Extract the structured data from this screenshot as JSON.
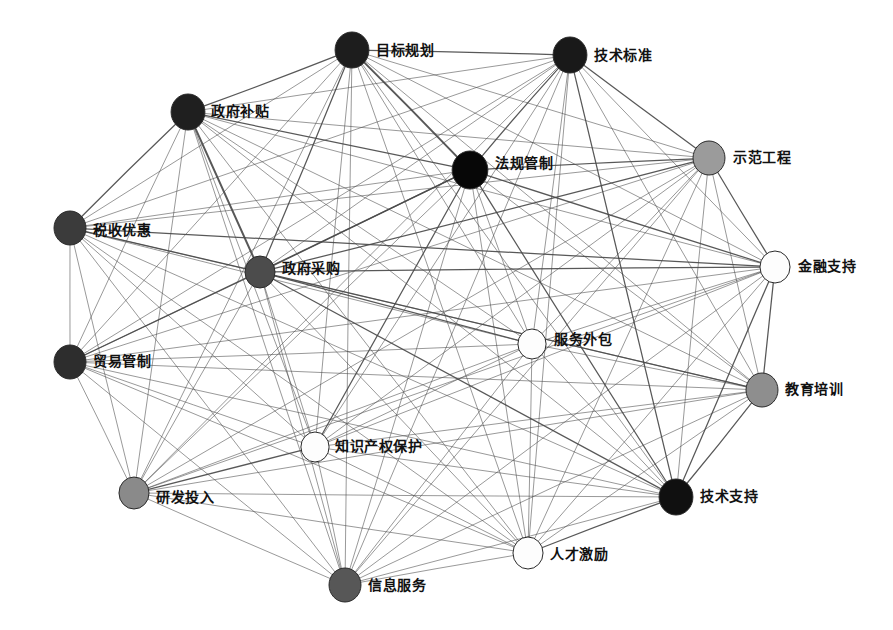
{
  "figure": {
    "type": "network-graph",
    "title": "",
    "background_color": "#ffffff",
    "width": 893,
    "height": 630,
    "edge_color": "#4a4a4a",
    "node_outline_color": "#2a2a2a"
  },
  "nodes": [
    {
      "id": "mubiao-guihua",
      "label": "目标规划",
      "x": 352,
      "y": 50,
      "r": 18,
      "color": "#1d1d1d",
      "label_dx": 24,
      "label_dy": 1
    },
    {
      "id": "jishu-biaozhun",
      "label": "技术标准",
      "x": 570,
      "y": 55,
      "r": 18,
      "color": "#191919",
      "label_dx": 24,
      "label_dy": 1
    },
    {
      "id": "zhengfu-butie",
      "label": "政府补贴",
      "x": 188,
      "y": 112,
      "r": 18,
      "color": "#1f1f1f",
      "label_dx": 23,
      "label_dy": 0
    },
    {
      "id": "fagui-guanzhi",
      "label": "法规管制",
      "x": 470,
      "y": 170,
      "r": 19,
      "color": "#070707",
      "label_dx": 25,
      "label_dy": -6
    },
    {
      "id": "shifan-gongcheng",
      "label": "示范工程",
      "x": 709,
      "y": 158,
      "r": 17,
      "color": "#9b9b9b",
      "label_dx": 24,
      "label_dy": 0
    },
    {
      "id": "shuishou-youhui",
      "label": "税收优惠",
      "x": 70,
      "y": 228,
      "r": 17,
      "color": "#3b3b3b",
      "label_dx": 23,
      "label_dy": 3
    },
    {
      "id": "zhengfu-caigou",
      "label": "政府采购",
      "x": 260,
      "y": 272,
      "r": 16,
      "color": "#4c4c4c",
      "label_dx": 22,
      "label_dy": -3
    },
    {
      "id": "jinrong-zhichi",
      "label": "金融支持",
      "x": 775,
      "y": 267,
      "r": 16,
      "color": "#fdfdfd",
      "label_dx": 23,
      "label_dy": 0
    },
    {
      "id": "fuwu-waibao",
      "label": "服务外包",
      "x": 532,
      "y": 344,
      "r": 15,
      "color": "#fdfdfd",
      "label_dx": 22,
      "label_dy": -4
    },
    {
      "id": "maoyi-guanzhi",
      "label": "贸易管制",
      "x": 70,
      "y": 362,
      "r": 17,
      "color": "#2d2d2d",
      "label_dx": 23,
      "label_dy": 0
    },
    {
      "id": "jiaoyu-peixun",
      "label": "教育培训",
      "x": 762,
      "y": 390,
      "r": 17,
      "color": "#8e8e8e",
      "label_dx": 23,
      "label_dy": 0
    },
    {
      "id": "zhishi-chanquan",
      "label": "知识产权保护",
      "x": 315,
      "y": 447,
      "r": 15,
      "color": "#fdfdfd",
      "label_dx": 20,
      "label_dy": 0
    },
    {
      "id": "yanfa-touru",
      "label": "研发投入",
      "x": 134,
      "y": 493,
      "r": 16,
      "color": "#8a8a8a",
      "label_dx": 22,
      "label_dy": 5
    },
    {
      "id": "jishu-zhichi",
      "label": "技术支持",
      "x": 676,
      "y": 497,
      "r": 18,
      "color": "#101010",
      "label_dx": 24,
      "label_dy": 0
    },
    {
      "id": "rencai-jili",
      "label": "人才激励",
      "x": 528,
      "y": 553,
      "r": 16,
      "color": "#fdfdfd",
      "label_dx": 22,
      "label_dy": 2
    },
    {
      "id": "xinxi-fuwu",
      "label": "信息服务",
      "x": 345,
      "y": 585,
      "r": 17,
      "color": "#575757",
      "label_dx": 23,
      "label_dy": 1
    }
  ],
  "chart_data": {
    "type": "network",
    "title": "",
    "node_count": 16,
    "node_order_dark_to_light": [
      "法规管制",
      "技术支持",
      "技术标准",
      "目标规划",
      "政府补贴",
      "贸易管制",
      "税收优惠",
      "政府采购",
      "信息服务",
      "研发投入",
      "教育培训",
      "示范工程",
      "金融支持",
      "服务外包",
      "知识产权保护",
      "人才激励"
    ],
    "edges": [
      [
        "目标规划",
        "技术标准",
        2
      ],
      [
        "目标规划",
        "政府补贴",
        2
      ],
      [
        "目标规划",
        "法规管制",
        3
      ],
      [
        "目标规划",
        "示范工程",
        1
      ],
      [
        "目标规划",
        "税收优惠",
        1
      ],
      [
        "目标规划",
        "政府采购",
        2
      ],
      [
        "目标规划",
        "金融支持",
        1
      ],
      [
        "目标规划",
        "服务外包",
        1
      ],
      [
        "目标规划",
        "贸易管制",
        1
      ],
      [
        "目标规划",
        "教育培训",
        1
      ],
      [
        "目标规划",
        "知识产权保护",
        1
      ],
      [
        "目标规划",
        "研发投入",
        1
      ],
      [
        "目标规划",
        "技术支持",
        1
      ],
      [
        "目标规划",
        "人才激励",
        1
      ],
      [
        "目标规划",
        "信息服务",
        1
      ],
      [
        "技术标准",
        "政府补贴",
        1
      ],
      [
        "技术标准",
        "法规管制",
        2
      ],
      [
        "技术标准",
        "示范工程",
        2
      ],
      [
        "技术标准",
        "税收优惠",
        1
      ],
      [
        "技术标准",
        "政府采购",
        1
      ],
      [
        "技术标准",
        "金融支持",
        1
      ],
      [
        "技术标准",
        "服务外包",
        1
      ],
      [
        "技术标准",
        "贸易管制",
        1
      ],
      [
        "技术标准",
        "教育培训",
        1
      ],
      [
        "技术标准",
        "知识产权保护",
        1
      ],
      [
        "技术标准",
        "研发投入",
        1
      ],
      [
        "技术标准",
        "技术支持",
        2
      ],
      [
        "技术标准",
        "人才激励",
        1
      ],
      [
        "技术标准",
        "信息服务",
        1
      ],
      [
        "政府补贴",
        "法规管制",
        2
      ],
      [
        "政府补贴",
        "示范工程",
        1
      ],
      [
        "政府补贴",
        "税收优惠",
        2
      ],
      [
        "政府补贴",
        "政府采购",
        3
      ],
      [
        "政府补贴",
        "金融支持",
        1
      ],
      [
        "政府补贴",
        "服务外包",
        1
      ],
      [
        "政府补贴",
        "贸易管制",
        1
      ],
      [
        "政府补贴",
        "教育培训",
        1
      ],
      [
        "政府补贴",
        "知识产权保护",
        1
      ],
      [
        "政府补贴",
        "研发投入",
        1
      ],
      [
        "政府补贴",
        "技术支持",
        1
      ],
      [
        "政府补贴",
        "人才激励",
        1
      ],
      [
        "政府补贴",
        "信息服务",
        1
      ],
      [
        "法规管制",
        "示范工程",
        2
      ],
      [
        "法规管制",
        "税收优惠",
        1
      ],
      [
        "法规管制",
        "政府采购",
        2
      ],
      [
        "法规管制",
        "金融支持",
        2
      ],
      [
        "法规管制",
        "服务外包",
        1
      ],
      [
        "法规管制",
        "贸易管制",
        2
      ],
      [
        "法规管制",
        "教育培训",
        1
      ],
      [
        "法规管制",
        "知识产权保护",
        2
      ],
      [
        "法规管制",
        "研发投入",
        1
      ],
      [
        "法规管制",
        "技术支持",
        2
      ],
      [
        "法规管制",
        "人才激励",
        1
      ],
      [
        "法规管制",
        "信息服务",
        1
      ],
      [
        "示范工程",
        "税收优惠",
        1
      ],
      [
        "示范工程",
        "政府采购",
        2
      ],
      [
        "示范工程",
        "金融支持",
        2
      ],
      [
        "示范工程",
        "服务外包",
        1
      ],
      [
        "示范工程",
        "贸易管制",
        1
      ],
      [
        "示范工程",
        "教育培训",
        1
      ],
      [
        "示范工程",
        "知识产权保护",
        1
      ],
      [
        "示范工程",
        "研发投入",
        1
      ],
      [
        "示范工程",
        "技术支持",
        1
      ],
      [
        "示范工程",
        "人才激励",
        1
      ],
      [
        "示范工程",
        "信息服务",
        1
      ],
      [
        "税收优惠",
        "政府采购",
        2
      ],
      [
        "税收优惠",
        "金融支持",
        2
      ],
      [
        "税收优惠",
        "服务外包",
        1
      ],
      [
        "税收优惠",
        "贸易管制",
        1
      ],
      [
        "税收优惠",
        "教育培训",
        1
      ],
      [
        "税收优惠",
        "知识产权保护",
        1
      ],
      [
        "税收优惠",
        "研发投入",
        1
      ],
      [
        "税收优惠",
        "技术支持",
        1
      ],
      [
        "税收优惠",
        "人才激励",
        1
      ],
      [
        "税收优惠",
        "信息服务",
        1
      ],
      [
        "政府采购",
        "金融支持",
        2
      ],
      [
        "政府采购",
        "服务外包",
        2
      ],
      [
        "政府采购",
        "贸易管制",
        1
      ],
      [
        "政府采购",
        "教育培训",
        2
      ],
      [
        "政府采购",
        "知识产权保护",
        1
      ],
      [
        "政府采购",
        "研发投入",
        1
      ],
      [
        "政府采购",
        "技术支持",
        2
      ],
      [
        "政府采购",
        "人才激励",
        1
      ],
      [
        "政府采购",
        "信息服务",
        1
      ],
      [
        "金融支持",
        "服务外包",
        1
      ],
      [
        "金融支持",
        "贸易管制",
        1
      ],
      [
        "金融支持",
        "教育培训",
        2
      ],
      [
        "金融支持",
        "知识产权保护",
        1
      ],
      [
        "金融支持",
        "研发投入",
        1
      ],
      [
        "金融支持",
        "技术支持",
        2
      ],
      [
        "金融支持",
        "人才激励",
        1
      ],
      [
        "金融支持",
        "信息服务",
        1
      ],
      [
        "服务外包",
        "贸易管制",
        1
      ],
      [
        "服务外包",
        "教育培训",
        1
      ],
      [
        "服务外包",
        "知识产权保护",
        1
      ],
      [
        "服务外包",
        "研发投入",
        1
      ],
      [
        "服务外包",
        "技术支持",
        1
      ],
      [
        "服务外包",
        "人才激励",
        1
      ],
      [
        "服务外包",
        "信息服务",
        1
      ],
      [
        "贸易管制",
        "教育培训",
        1
      ],
      [
        "贸易管制",
        "知识产权保护",
        1
      ],
      [
        "贸易管制",
        "研发投入",
        1
      ],
      [
        "贸易管制",
        "技术支持",
        1
      ],
      [
        "贸易管制",
        "人才激励",
        1
      ],
      [
        "贸易管制",
        "信息服务",
        1
      ],
      [
        "教育培训",
        "知识产权保护",
        1
      ],
      [
        "教育培训",
        "研发投入",
        1
      ],
      [
        "教育培训",
        "技术支持",
        2
      ],
      [
        "教育培训",
        "人才激励",
        1
      ],
      [
        "教育培训",
        "信息服务",
        1
      ],
      [
        "知识产权保护",
        "研发投入",
        2
      ],
      [
        "知识产权保护",
        "技术支持",
        1
      ],
      [
        "知识产权保护",
        "人才激励",
        1
      ],
      [
        "知识产权保护",
        "信息服务",
        1
      ],
      [
        "研发投入",
        "技术支持",
        1
      ],
      [
        "研发投入",
        "人才激励",
        1
      ],
      [
        "研发投入",
        "信息服务",
        1
      ],
      [
        "技术支持",
        "人才激励",
        2
      ],
      [
        "技术支持",
        "信息服务",
        1
      ],
      [
        "人才激励",
        "信息服务",
        1
      ]
    ]
  }
}
